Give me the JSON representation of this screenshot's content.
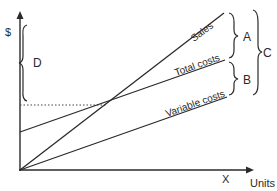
{
  "diagram": {
    "type": "breakeven-chart",
    "axes": {
      "y_label": "$",
      "x_label": "Units",
      "x_marker": "X"
    },
    "lines": [
      {
        "name": "sales",
        "label": "Sales",
        "from": [
          20,
          170
        ],
        "to": [
          224,
          13
        ]
      },
      {
        "name": "total-costs",
        "label": "Total costs",
        "from": [
          20,
          132
        ],
        "to": [
          225,
          60
        ]
      },
      {
        "name": "variable-costs",
        "label": "Variable costs",
        "from": [
          20,
          170
        ],
        "to": [
          227,
          97
        ]
      }
    ],
    "breakeven_guide": {
      "y": 105,
      "x_end": 106
    },
    "braces": [
      {
        "label": "D",
        "side": "left"
      },
      {
        "label": "A",
        "side": "right"
      },
      {
        "label": "B",
        "side": "right"
      },
      {
        "label": "C",
        "side": "right"
      }
    ]
  }
}
